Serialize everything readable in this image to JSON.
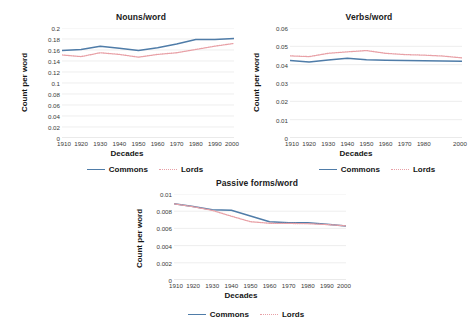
{
  "figure": {
    "background": "#ffffff",
    "series_colors": {
      "commons": "#4f7ca8",
      "lords": "#e8a0a6"
    }
  },
  "legend": {
    "commons_label": "Commons",
    "lords_label": "Lords"
  },
  "charts": [
    {
      "id": "nouns",
      "title": "Nouns/word",
      "xlabel": "Decades",
      "ylabel": "Count per word"
    },
    {
      "id": "verbs",
      "title": "Verbs/word",
      "xlabel": "Decades",
      "ylabel": "Count per word"
    },
    {
      "id": "passives",
      "title": "Passive forms/word",
      "xlabel": "Decades",
      "ylabel": "Count per word"
    }
  ],
  "chart_data": [
    {
      "type": "line",
      "id": "nouns",
      "title": "Nouns/word",
      "xlabel": "Decades",
      "ylabel": "Count per word",
      "categories": [
        "1910",
        "1920",
        "1930",
        "1940",
        "1950",
        "1960",
        "1970",
        "1980",
        "1990",
        "2000"
      ],
      "tick_labels": [
        "1910",
        "1920",
        "1930",
        "1940",
        "1950",
        "1960",
        "1970",
        "1980",
        "1990",
        "2000"
      ],
      "yticks": [
        0,
        0.02,
        0.04,
        0.06,
        0.08,
        0.1,
        0.12,
        0.14,
        0.16,
        0.18,
        0.2
      ],
      "ytick_labels": [
        "0",
        "0.02",
        "0.04",
        "0.06",
        "0.08",
        "0.1",
        "0.12",
        "0.14",
        "0.16",
        "0.18",
        "0.2"
      ],
      "ylim": [
        0,
        0.2
      ],
      "grid": true,
      "legend_position": "bottom",
      "series": [
        {
          "name": "Commons",
          "style": "solid",
          "color": "#4f7ca8",
          "values": [
            0.159,
            0.161,
            0.167,
            0.163,
            0.159,
            0.164,
            0.171,
            0.179,
            0.179,
            0.181
          ]
        },
        {
          "name": "Lords",
          "style": "dotted",
          "color": "#e8a0a6",
          "values": [
            0.151,
            0.148,
            0.155,
            0.152,
            0.147,
            0.152,
            0.155,
            0.161,
            0.167,
            0.172
          ]
        }
      ]
    },
    {
      "type": "line",
      "id": "verbs",
      "title": "Verbs/word",
      "xlabel": "Decades",
      "ylabel": "Count per word",
      "categories": [
        "1910",
        "1920",
        "1930",
        "1940",
        "1950",
        "1960",
        "1970",
        "1980",
        "1990",
        "2000"
      ],
      "tick_labels": [
        "1910",
        "1920",
        "1930",
        "1940",
        "1950",
        "1960",
        "1970",
        "1980",
        "2000"
      ],
      "yticks": [
        0,
        0.01,
        0.02,
        0.03,
        0.04,
        0.05,
        0.06
      ],
      "ytick_labels": [
        "0",
        "0.01",
        "0.02",
        "0.03",
        "0.04",
        "0.05",
        "0.06"
      ],
      "ylim": [
        0,
        0.06
      ],
      "grid": true,
      "legend_position": "bottom",
      "series": [
        {
          "name": "Commons",
          "style": "solid",
          "color": "#4f7ca8",
          "values": [
            0.0423,
            0.0414,
            0.0425,
            0.0435,
            0.0427,
            0.0424,
            0.0423,
            0.0422,
            0.042,
            0.0418
          ]
        },
        {
          "name": "Lords",
          "style": "dotted",
          "color": "#e8a0a6",
          "values": [
            0.0448,
            0.0444,
            0.0462,
            0.047,
            0.0477,
            0.0462,
            0.0455,
            0.0452,
            0.0447,
            0.0437
          ]
        }
      ]
    },
    {
      "type": "line",
      "id": "passives",
      "title": "Passive forms/word",
      "xlabel": "Decades",
      "ylabel": "Count per word",
      "categories": [
        "1910",
        "1920",
        "1930",
        "1940",
        "1950",
        "1960",
        "1970",
        "1980",
        "1990",
        "2000"
      ],
      "tick_labels": [
        "1910",
        "1920",
        "1930",
        "1940",
        "1950",
        "1960",
        "1970",
        "1980",
        "1990",
        "2000"
      ],
      "yticks": [
        0,
        0.002,
        0.004,
        0.006,
        0.008,
        0.01
      ],
      "ytick_labels": [
        "0",
        "0.002",
        "0.004",
        "0.006",
        "0.008",
        "0.01"
      ],
      "ylim": [
        0,
        0.01
      ],
      "grid": true,
      "legend_position": "bottom",
      "series": [
        {
          "name": "Commons",
          "style": "solid",
          "color": "#4f7ca8",
          "values": [
            0.00888,
            0.00855,
            0.00818,
            0.0081,
            0.00745,
            0.00678,
            0.00665,
            0.00665,
            0.00648,
            0.00628
          ]
        },
        {
          "name": "Lords",
          "style": "dotted",
          "color": "#e8a0a6",
          "values": [
            0.00886,
            0.00852,
            0.0081,
            0.00742,
            0.00678,
            0.0066,
            0.00658,
            0.00655,
            0.00645,
            0.0063
          ]
        }
      ]
    }
  ]
}
